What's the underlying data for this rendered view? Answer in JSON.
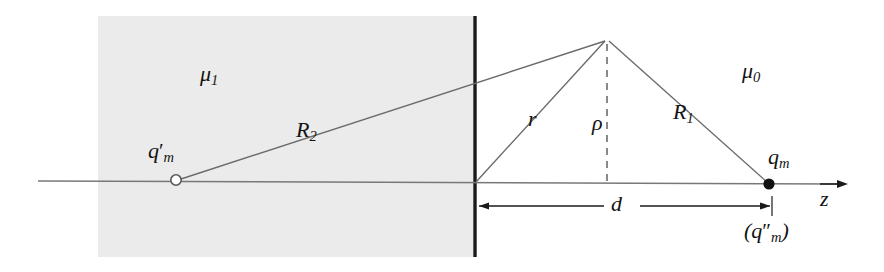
{
  "figure": {
    "name": "magnetic-image-charge-diagram",
    "background_color": "#ffffff",
    "media_region_color": "#ebebeb",
    "line_color": "#6b6b6b",
    "boundary_color": "#1a1a1a",
    "label_color": "#131313"
  },
  "labels": {
    "mu1": "μ",
    "mu1_sub": "1",
    "mu0": "μ",
    "mu0_sub": "0",
    "q_m_prime": "q",
    "q_m_prime_sub": "m",
    "q_m_prime_mark": "′",
    "R2": "R",
    "R2_sub": "2",
    "r": "r",
    "rho": "ρ",
    "R1": "R",
    "R1_sub": "1",
    "q_m": "q",
    "q_m_sub": "m",
    "d": "d",
    "q_m_dprime_open": "(q",
    "q_m_dprime_sub": "m",
    "q_m_dprime_mark": "″",
    "q_m_dprime_close": ")",
    "z_axis": "z"
  },
  "geometry": {
    "medium_rect": {
      "x": 98,
      "y": 16,
      "width": 375,
      "height": 241
    },
    "interface_line_x": 475,
    "interface_line_y1": 16,
    "interface_line_y2": 257,
    "axis_y": 184,
    "axis_x_start": 38,
    "axis_x_end": 848,
    "source_point": {
      "x": 769,
      "y": 184,
      "marker": "filled-dot"
    },
    "image_point": {
      "x": 176,
      "y": 180,
      "marker": "open-circle"
    },
    "field_point": {
      "x": 607,
      "y": 40
    },
    "interface_foot": {
      "x": 475,
      "y": 183
    },
    "dimension_line": {
      "y": 206,
      "x_start": 476,
      "x_end": 772
    }
  },
  "markers": {
    "filled_dot_label": "q_m source charge",
    "open_circle_label": "q_m prime image charge"
  }
}
